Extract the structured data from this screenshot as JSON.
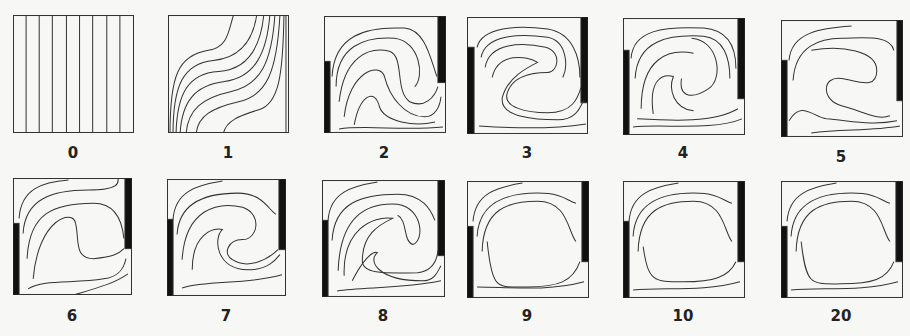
{
  "figure": {
    "panels": [
      {
        "label": "0",
        "x": 13,
        "y": 15,
        "w": 120,
        "h": 117
      },
      {
        "label": "1",
        "x": 168,
        "y": 15,
        "w": 120,
        "h": 117
      },
      {
        "label": "2",
        "x": 324,
        "y": 16,
        "w": 121,
        "h": 116
      },
      {
        "label": "3",
        "x": 467,
        "y": 17,
        "w": 120,
        "h": 116
      },
      {
        "label": "4",
        "x": 623,
        "y": 18,
        "w": 121,
        "h": 116
      },
      {
        "label": "5",
        "x": 781,
        "y": 20,
        "w": 121,
        "h": 116
      },
      {
        "label": "6",
        "x": 13,
        "y": 178,
        "w": 118,
        "h": 116
      },
      {
        "label": "7",
        "x": 167,
        "y": 179,
        "w": 118,
        "h": 116
      },
      {
        "label": "8",
        "x": 322,
        "y": 180,
        "w": 122,
        "h": 116
      },
      {
        "label": "9",
        "x": 467,
        "y": 181,
        "w": 121,
        "h": 116
      },
      {
        "label": "10",
        "x": 623,
        "y": 181,
        "w": 121,
        "h": 116
      },
      {
        "label": "20",
        "x": 781,
        "y": 181,
        "w": 121,
        "h": 116
      }
    ]
  }
}
